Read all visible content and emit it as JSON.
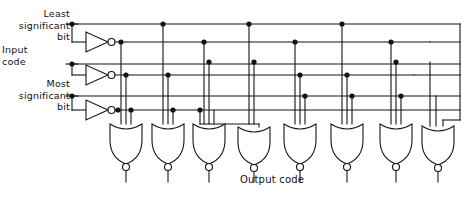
{
  "diagram": {
    "type": "logic-circuit-schematic",
    "stroke_color": "#141414",
    "background_color": "#ffffff",
    "labels": {
      "least_significant_bit": "Least\nsignificant\nbit",
      "input_code": "Input\ncode",
      "most_significant_bit": "Most\nsignificant\nbit",
      "output_code": "Output code"
    },
    "inputs": [
      {
        "name": "least-significant-bit",
        "label_lines": [
          "Least",
          "significant",
          "bit"
        ],
        "y": 24
      },
      {
        "name": "input-code-middle-bit",
        "label_lines": [
          "Input",
          "code"
        ],
        "y": 64
      },
      {
        "name": "most-significant-bit",
        "label_lines": [
          "Most",
          "significant",
          "bit"
        ],
        "y": 96
      }
    ],
    "inverters": [
      {
        "name": "inverter-lsb",
        "x": 82,
        "y": 42,
        "bubble": true
      },
      {
        "name": "inverter-mid",
        "x": 82,
        "y": 74,
        "bubble": true
      },
      {
        "name": "inverter-msb",
        "x": 82,
        "y": 110,
        "bubble": true
      }
    ],
    "bus_lines": [
      {
        "name": "bus-lsb-true",
        "y": 24,
        "source": "least-significant-bit"
      },
      {
        "name": "bus-lsb-not",
        "y": 44,
        "source": "inverter-lsb"
      },
      {
        "name": "bus-mid-true",
        "y": 62,
        "source": "input-code-middle-bit"
      },
      {
        "name": "bus-mid-not",
        "y": 75,
        "source": "inverter-mid"
      },
      {
        "name": "bus-msb-true",
        "y": 94,
        "source": "most-significant-bit"
      },
      {
        "name": "bus-msb-not",
        "y": 112,
        "source": "inverter-msb"
      }
    ],
    "gates": [
      {
        "name": "nor-gate-0",
        "x": 126,
        "inputs": [
          "bus-lsb-not",
          "bus-mid-not",
          "bus-msb-not"
        ]
      },
      {
        "name": "nor-gate-1",
        "x": 168,
        "inputs": [
          "bus-lsb-true",
          "bus-mid-not",
          "bus-msb-not"
        ]
      },
      {
        "name": "nor-gate-2",
        "x": 209,
        "inputs": [
          "bus-lsb-not",
          "bus-mid-true",
          "bus-msb-not"
        ]
      },
      {
        "name": "nor-gate-3",
        "x": 254,
        "inputs": [
          "bus-lsb-true",
          "bus-mid-true",
          "bus-msb-not"
        ]
      },
      {
        "name": "nor-gate-4",
        "x": 300,
        "inputs": [
          "bus-lsb-not",
          "bus-mid-not",
          "bus-msb-true"
        ]
      },
      {
        "name": "nor-gate-5",
        "x": 347,
        "inputs": [
          "bus-lsb-true",
          "bus-mid-not",
          "bus-msb-true"
        ]
      },
      {
        "name": "nor-gate-6",
        "x": 396,
        "inputs": [
          "bus-lsb-not",
          "bus-mid-true",
          "bus-msb-true"
        ]
      },
      {
        "name": "nor-gate-7",
        "x": 438,
        "inputs": [
          "bus-lsb-true",
          "bus-mid-true",
          "bus-msb-true"
        ]
      }
    ],
    "gate_count": 8,
    "gate_type": "NOR",
    "inverter_count": 3,
    "gate_inputs_each": 3,
    "junction_dots": [
      {
        "bus": "bus-lsb-true",
        "x": [
          177,
          265,
          358
        ]
      },
      {
        "bus": "bus-lsb-not",
        "x": [
          138,
          220,
          312
        ]
      },
      {
        "bus": "bus-mid-true",
        "x": [
          208,
          255,
          397
        ]
      },
      {
        "bus": "bus-mid-not",
        "x": [
          126,
          168,
          300
        ]
      },
      {
        "bus": "bus-msb-true",
        "x": [
          290,
          337,
          385
        ]
      },
      {
        "bus": "bus-msb-not",
        "x": [
          156,
          200
        ]
      }
    ]
  }
}
